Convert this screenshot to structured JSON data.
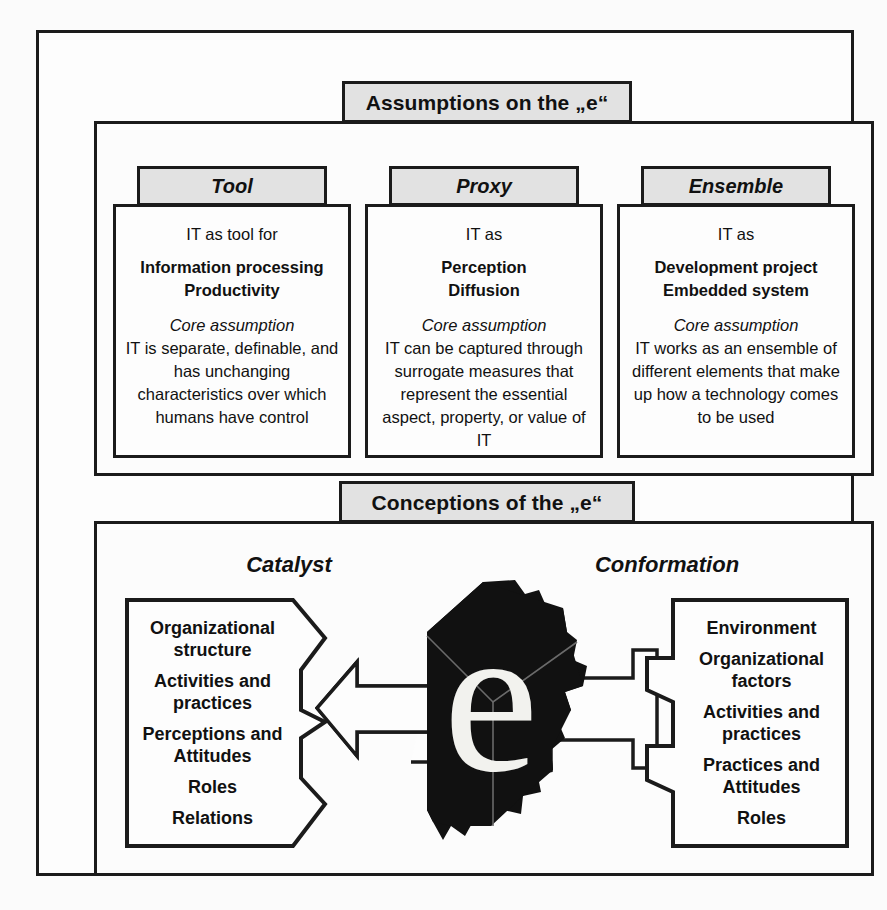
{
  "diagram": {
    "sections": [
      {
        "id": "assumptions",
        "title": "Assumptions on the „e“",
        "columns": [
          {
            "tab": "Tool",
            "lead": "IT as tool for",
            "strong": [
              "Information processing",
              "Productivity"
            ],
            "core_label": "Core assumption",
            "description": "IT is separate, definable, and has unchanging characteristics over which humans have control"
          },
          {
            "tab": "Proxy",
            "lead": "IT as",
            "strong": [
              "Perception",
              "Diffusion"
            ],
            "core_label": "Core assumption",
            "description": "IT can be captured through surrogate measures that represent the essential aspect, property, or value of IT"
          },
          {
            "tab": "Ensemble",
            "lead": "IT as",
            "strong": [
              "Development project",
              "Embedded system"
            ],
            "core_label": "Core assumption",
            "description": "IT works as an ensemble of different elements that make up how a technology comes to be used"
          }
        ]
      },
      {
        "id": "conceptions",
        "title": "Conceptions of the „e“",
        "groups": [
          {
            "heading": "Catalyst",
            "items": [
              "Organizational structure",
              "Activities and practices",
              "Perceptions and Attitudes",
              "Roles",
              "Relations"
            ]
          },
          {
            "heading": "Conformation",
            "items": [
              "Environment",
              "Organizational factors",
              "Activities and practices",
              "Practices and Attitudes",
              "Roles"
            ]
          }
        ],
        "center_glyph": "e"
      }
    ],
    "colors": {
      "line": "#1b1b1b",
      "tab_fill": "#e2e2e2",
      "panel_fill": "#fdfdfd",
      "page_background": "#fbfbfb",
      "glyph_cube": "#111111",
      "glyph_letter": "#f2f2ee"
    }
  }
}
